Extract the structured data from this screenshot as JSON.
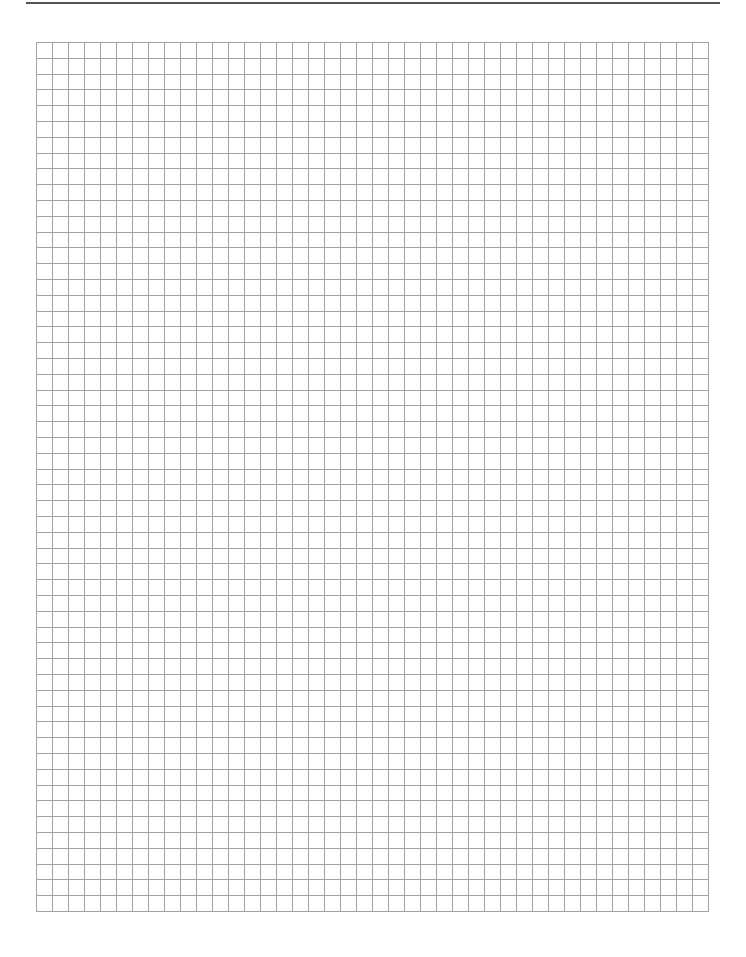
{
  "page": {
    "type": "graph paper",
    "header_text": "",
    "background_color": "#ffffff",
    "header_rule_color": "#555555"
  },
  "grid": {
    "columns": 42,
    "rows": 55,
    "cell_width_px": 16,
    "cell_height_px": 15.8,
    "line_color": "#a3a3a3",
    "line_width": 1
  }
}
